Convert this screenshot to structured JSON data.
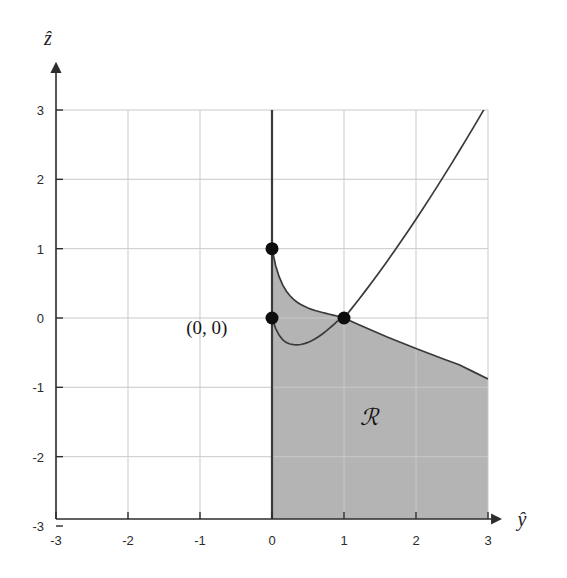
{
  "chart_data": {
    "type": "area",
    "title": "",
    "subtitle": "",
    "xlabel": "ŷ",
    "ylabel": "ẑ",
    "xlim": [
      -3,
      3
    ],
    "ylim": [
      -3,
      3
    ],
    "grid": true,
    "legend": null,
    "x_ticks": [
      "-3",
      "-2",
      "-1",
      "0",
      "1",
      "2",
      "3"
    ],
    "x_tick_values": [
      -3,
      -2,
      -1,
      0,
      1,
      2,
      3
    ],
    "y_ticks": [
      "3",
      "2",
      "1",
      "0",
      "-1",
      "-2",
      "-3"
    ],
    "y_tick_values": [
      3,
      2,
      1,
      0,
      -1,
      -2,
      -3
    ],
    "annotations": [
      {
        "text": "(0, 0)",
        "x": -0.62,
        "y": -0.23,
        "name": "origin-point-label"
      },
      {
        "text": "ℛ",
        "x": 1.35,
        "y": -1.55,
        "name": "region-label"
      }
    ],
    "marked_points": [
      {
        "x": 0,
        "y": 1,
        "label": "(0, 1)"
      },
      {
        "x": 0,
        "y": 0,
        "label": "(0, 0)"
      },
      {
        "x": 1,
        "y": 0,
        "label": "(1, 0)"
      }
    ],
    "series": [
      {
        "name": "upper-boundary-decaying",
        "description": "Decreasing convex curve from (0,1) to (1,0)",
        "x": [
          0.0,
          0.05,
          0.1,
          0.15,
          0.2,
          0.25,
          0.3,
          0.35,
          0.4,
          0.45,
          0.5,
          0.55,
          0.6,
          0.65,
          0.7,
          0.75,
          0.8,
          0.85,
          0.9,
          0.95,
          1.0
        ],
        "values": [
          1.0,
          0.757,
          0.592,
          0.474,
          0.387,
          0.321,
          0.269,
          0.228,
          0.195,
          0.168,
          0.145,
          0.125,
          0.108,
          0.093,
          0.079,
          0.066,
          0.054,
          0.041,
          0.029,
          0.015,
          0.0
        ]
      },
      {
        "name": "upper-boundary-rising",
        "description": "Increasing slightly convex curve from (1,0) to (3,2.85)",
        "x": [
          1.0,
          1.1,
          1.2,
          1.3,
          1.4,
          1.5,
          1.6,
          1.7,
          1.8,
          1.9,
          2.0,
          2.1,
          2.2,
          2.3,
          2.4,
          2.5,
          2.6,
          2.7,
          2.8,
          2.9,
          3.0
        ],
        "values": [
          0.0,
          0.128,
          0.26,
          0.395,
          0.534,
          0.675,
          0.82,
          0.967,
          1.117,
          1.27,
          1.425,
          1.583,
          1.743,
          1.906,
          2.071,
          2.238,
          2.408,
          2.58,
          2.754,
          2.93,
          3.108
        ]
      },
      {
        "name": "lower-boundary-dip",
        "description": "Dipping curve from (0,0) through minimum near (0.42,-0.38) back to (1,0)",
        "x": [
          0.0,
          0.05,
          0.1,
          0.15,
          0.2,
          0.25,
          0.3,
          0.35,
          0.4,
          0.45,
          0.5,
          0.55,
          0.6,
          0.65,
          0.7,
          0.75,
          0.8,
          0.85,
          0.9,
          0.95,
          1.0
        ],
        "values": [
          0.0,
          -0.15,
          -0.25,
          -0.315,
          -0.355,
          -0.375,
          -0.385,
          -0.387,
          -0.382,
          -0.37,
          -0.352,
          -0.328,
          -0.3,
          -0.267,
          -0.23,
          -0.19,
          -0.147,
          -0.101,
          -0.052,
          -0.02,
          0.0
        ]
      },
      {
        "name": "lower-boundary-falling",
        "description": "Gently falling near-linear curve from (1,0) to (3,-0.88)",
        "x": [
          1.0,
          1.2,
          1.4,
          1.6,
          1.8,
          2.0,
          2.2,
          2.4,
          2.6,
          2.8,
          3.0
        ],
        "values": [
          0.0,
          -0.094,
          -0.185,
          -0.273,
          -0.358,
          -0.44,
          -0.52,
          -0.598,
          -0.673,
          -0.777,
          -0.88
        ]
      }
    ],
    "shaded_region": {
      "name": "R",
      "fill_color": "#b4b4b4",
      "description": "Region bounded left by the line y-hat = 0 from z-hat = -3 upward, above by the decaying curve from (0,1) to (1,0) then the falling curve to (3,-0.88), right by y-hat = 3, and below by z-hat = -3"
    },
    "colors": {
      "curve": "#3a3a3a",
      "axis": "#2d2d2d",
      "grid": "#c9c9c9",
      "fill": "#b4b4b4",
      "point": "#0d0d0d",
      "background": "#ffffff"
    }
  },
  "figure": {
    "y_axis_label": "ẑ",
    "x_axis_label": "ŷ",
    "origin_label": "(0, 0)",
    "region_label": "ℛ"
  }
}
